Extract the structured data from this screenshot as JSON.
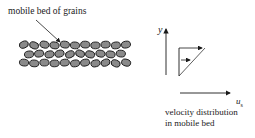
{
  "diagram": {
    "bed_label": "mobile bed of grains",
    "y_axis_label": "y",
    "x_axis_label": "u",
    "x_axis_subscript": "s",
    "caption_line1": "velocity distribution",
    "caption_line2": "in mobile bed",
    "grain_rows": [
      {
        "y": 45,
        "x_start": 24,
        "count": 11
      },
      {
        "y": 54,
        "x_start": 29,
        "count": 10
      },
      {
        "y": 63,
        "x_start": 24,
        "count": 11
      }
    ],
    "colors": {
      "ink": "#1a1a1a",
      "grain_fill": "#8a8a8a",
      "background": "#ffffff"
    }
  }
}
